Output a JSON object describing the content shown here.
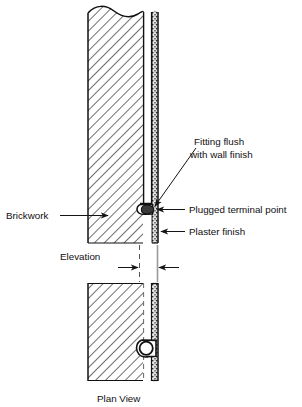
{
  "figure": {
    "kind": "architectural-detail-drawing",
    "background_color": "#ffffff",
    "line_color": "#141414"
  },
  "labels": {
    "brickwork": "Brickwork",
    "fitting_flush_line1": "Fitting flush",
    "fitting_flush_line2": "with wall finish",
    "plugged_terminal_point": "Plugged terminal point",
    "plaster_finish": "Plaster finish",
    "elevation": "Elevation",
    "plan_view": "Plan View"
  },
  "icons": {
    "arrow_brickwork": "arrow-right-icon",
    "arrow_fitting": "arrow-down-left-icon",
    "arrow_terminal": "arrow-left-icon",
    "arrow_plaster": "arrow-left-icon",
    "dimension_arrow_left": "arrow-right-icon",
    "dimension_arrow_right": "arrow-left-icon",
    "break_line": "wavy-break-line-icon"
  },
  "elevation_view": {
    "name": "Elevation",
    "layers": [
      {
        "name": "Brickwork",
        "hatch": "diagonal-45",
        "x_start": 88,
        "x_end": 143
      },
      {
        "name": "Conduit chase",
        "fill": "white",
        "x_start": 143,
        "x_end": 152
      },
      {
        "name": "Plaster finish",
        "hatch": "stipple",
        "x_start": 152,
        "x_end": 158
      }
    ],
    "top_edge": "wavy break line",
    "bottom_y": 243,
    "terminal_fitting": {
      "shape": "oval-boss",
      "center_x": 148,
      "center_y": 209
    }
  },
  "plan_view": {
    "name": "Plan View",
    "layers": [
      {
        "name": "Brickwork",
        "hatch": "diagonal-45",
        "x_start": 88,
        "x_end": 143
      },
      {
        "name": "Conduit chase",
        "fill": "white",
        "x_start": 143,
        "x_end": 152
      },
      {
        "name": "Plaster finish",
        "hatch": "stipple",
        "x_start": 152,
        "x_end": 158
      }
    ],
    "top_y": 283,
    "bottom_y": 381,
    "terminal_fitting": {
      "shape": "circle-in-boss",
      "center_x": 148,
      "center_y": 348
    }
  },
  "dimension": {
    "label": "Elevation",
    "left_guide_x": 139,
    "right_guide_x": 157,
    "y": 268
  }
}
